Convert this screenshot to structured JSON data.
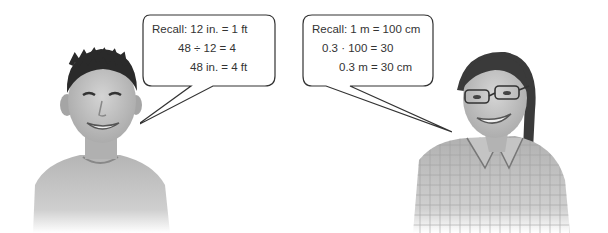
{
  "scene": {
    "description": "Two students with speech bubbles recalling unit conversions",
    "colors": {
      "bubble_stroke": "#333333",
      "text": "#333333",
      "photo_tone": "#8a8a8a"
    }
  },
  "left_student": {
    "label": "boy",
    "bubble": {
      "lines": [
        "Recall: 12 in. = 1 ft",
        "48 ÷ 12 = 4",
        "48 in. = 4 ft"
      ]
    }
  },
  "right_student": {
    "label": "girl with glasses",
    "bubble": {
      "lines": [
        "Recall: 1 m = 100 cm",
        "0.3 · 100 = 30",
        "0.3 m = 30 cm"
      ]
    }
  }
}
